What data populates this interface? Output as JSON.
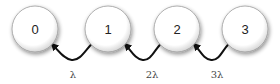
{
  "diagram": {
    "type": "birth-death chain",
    "nodes": [
      {
        "id": "0",
        "label": "0"
      },
      {
        "id": "1",
        "label": "1"
      },
      {
        "id": "2",
        "label": "2"
      },
      {
        "id": "3",
        "label": "3"
      }
    ],
    "edges": [
      {
        "from": "1",
        "to": "0",
        "label": "λ"
      },
      {
        "from": "2",
        "to": "1",
        "label": "2λ"
      },
      {
        "from": "3",
        "to": "2",
        "label": "3λ"
      }
    ]
  }
}
